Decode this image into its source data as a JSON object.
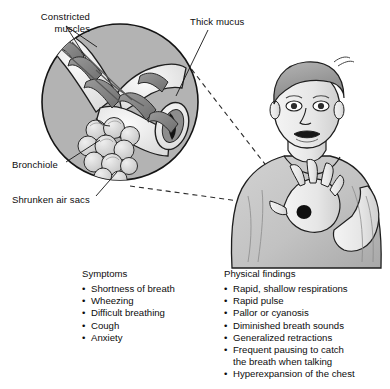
{
  "figure": {
    "callouts": [
      {
        "id": "constricted-muscles",
        "text": "Constricted\nmuscles"
      },
      {
        "id": "thick-mucus",
        "text": "Thick mucus"
      },
      {
        "id": "bronchiole",
        "text": "Bronchiole"
      },
      {
        "id": "shrunken-air-sacs",
        "text": "Shrunken air sacs"
      }
    ],
    "magnifier": {
      "name": "bronchiole-magnified-view",
      "fill": "#b3b3b3",
      "stroke": "#1a1a1a"
    },
    "patient": {
      "name": "boy-in-respiratory-distress",
      "skin": "#e9e9e9",
      "shirt": "#c4c4c4",
      "hair": "#9a9a9a"
    },
    "connector": {
      "name": "dashed-connector-lines",
      "color": "#2b2b2b",
      "style": "dashed"
    }
  },
  "symptoms": {
    "title": "Symptoms",
    "items": [
      "Shortness of breath",
      "Wheezing",
      "Difficult breathing",
      "Cough",
      "Anxiety"
    ]
  },
  "physical_findings": {
    "title": "Physical findings",
    "items": [
      "Rapid, shallow respirations",
      "Rapid pulse",
      "Pallor or cyanosis",
      "Diminished breath sounds",
      "Generalized retractions",
      "Frequent pausing to catch\n the breath when talking",
      "Hyperexpansion of the chest"
    ]
  }
}
